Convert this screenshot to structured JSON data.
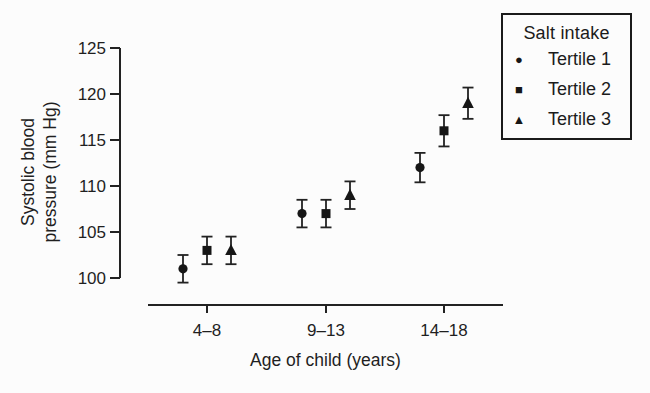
{
  "chart_data": {
    "type": "scatter",
    "title": "",
    "xlabel": "Age of child (years)",
    "ylabel_lines": [
      "Systolic blood",
      "pressure (mm Hg)"
    ],
    "categories": [
      "4–8",
      "9–13",
      "14–18"
    ],
    "ylim": [
      100,
      125
    ],
    "yticks": [
      100,
      105,
      110,
      115,
      120,
      125
    ],
    "grid": false,
    "error_bars": true,
    "series": [
      {
        "name": "Tertile 1",
        "marker": "circle",
        "values": [
          101,
          107,
          112
        ],
        "errors": [
          1.5,
          1.5,
          1.6
        ]
      },
      {
        "name": "Tertile 2",
        "marker": "square",
        "values": [
          103,
          107,
          116
        ],
        "errors": [
          1.5,
          1.5,
          1.7
        ]
      },
      {
        "name": "Tertile 3",
        "marker": "triangle",
        "values": [
          103,
          109,
          119
        ],
        "errors": [
          1.5,
          1.5,
          1.7
        ]
      }
    ],
    "legend": {
      "title": "Salt intake",
      "position": "top-right"
    }
  },
  "legend": {
    "title": "Salt intake",
    "items": [
      {
        "label": "Tertile 1",
        "marker": "circle",
        "glyph": "●"
      },
      {
        "label": "Tertile 2",
        "marker": "square",
        "glyph": "■"
      },
      {
        "label": "Tertile 3",
        "marker": "triangle",
        "glyph": "▲"
      }
    ]
  },
  "colors": {
    "ink": "#222222",
    "text": "#1f1f1f",
    "background": "#fcfcfc"
  }
}
